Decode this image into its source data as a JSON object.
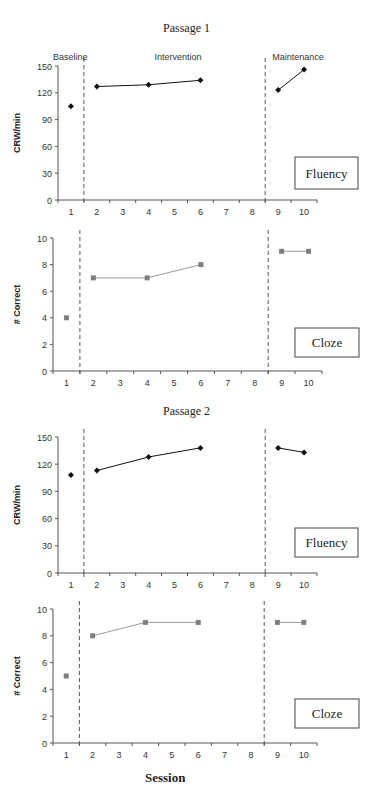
{
  "figure": {
    "xlabel": "Session",
    "phase_labels": {
      "baseline": "Baseline",
      "intervention": "Intervention",
      "maintenance": "Maintenance"
    }
  },
  "colors": {
    "fluency_series": "#111111",
    "cloze_series": "#7f7f7f",
    "cloze_line": "#999999",
    "axis": "#555555",
    "phase_line": "#555555",
    "text": "#333333"
  },
  "chart_data": [
    {
      "id": "passage1-fluency",
      "type": "line",
      "section_title": "Passage 1",
      "title": "Fluency",
      "xlabel": "",
      "ylabel": "CRW/min",
      "ylim": [
        0,
        150
      ],
      "yticks": [
        0,
        30,
        60,
        90,
        120,
        150
      ],
      "categories": [
        1,
        2,
        3,
        4,
        5,
        6,
        7,
        8,
        9,
        10
      ],
      "phase_lines_after_session": [
        1,
        8
      ],
      "marker": "diamond",
      "show_phase_labels": true,
      "series": [
        {
          "name": "Baseline",
          "x": [
            1
          ],
          "values": [
            105
          ]
        },
        {
          "name": "Intervention",
          "x": [
            2,
            4,
            6
          ],
          "values": [
            127,
            129,
            134
          ]
        },
        {
          "name": "Maintenance",
          "x": [
            9,
            10
          ],
          "values": [
            123,
            146
          ]
        }
      ],
      "grid": false,
      "legend": "none"
    },
    {
      "id": "passage1-cloze",
      "type": "line",
      "title": "Cloze",
      "xlabel": "",
      "ylabel": "# Correct",
      "ylim": [
        0,
        10
      ],
      "yticks": [
        0,
        2,
        4,
        6,
        8,
        10
      ],
      "categories": [
        1,
        2,
        3,
        4,
        5,
        6,
        7,
        8,
        9,
        10
      ],
      "phase_lines_after_session": [
        1,
        8
      ],
      "marker": "square",
      "show_phase_labels": false,
      "series": [
        {
          "name": "Baseline",
          "x": [
            1
          ],
          "values": [
            4
          ]
        },
        {
          "name": "Intervention",
          "x": [
            2,
            4,
            6
          ],
          "values": [
            7,
            7,
            8
          ]
        },
        {
          "name": "Maintenance",
          "x": [
            9,
            10
          ],
          "values": [
            9,
            9
          ]
        }
      ],
      "grid": false,
      "legend": "none"
    },
    {
      "id": "passage2-fluency",
      "type": "line",
      "section_title": "Passage 2",
      "title": "Fluency",
      "xlabel": "",
      "ylabel": "CRW/min",
      "ylim": [
        0,
        150
      ],
      "yticks": [
        0,
        30,
        60,
        90,
        120,
        150
      ],
      "categories": [
        1,
        2,
        3,
        4,
        5,
        6,
        7,
        8,
        9,
        10
      ],
      "phase_lines_after_session": [
        1,
        8
      ],
      "marker": "diamond",
      "show_phase_labels": false,
      "series": [
        {
          "name": "Baseline",
          "x": [
            1
          ],
          "values": [
            108
          ]
        },
        {
          "name": "Intervention",
          "x": [
            2,
            4,
            6
          ],
          "values": [
            113,
            128,
            138
          ]
        },
        {
          "name": "Maintenance",
          "x": [
            9,
            10
          ],
          "values": [
            138,
            133
          ]
        }
      ],
      "grid": false,
      "legend": "none"
    },
    {
      "id": "passage2-cloze",
      "type": "line",
      "title": "Cloze",
      "xlabel": "Session",
      "ylabel": "# Correct",
      "ylim": [
        0,
        10
      ],
      "yticks": [
        0,
        2,
        4,
        6,
        8,
        10
      ],
      "categories": [
        1,
        2,
        3,
        4,
        5,
        6,
        7,
        8,
        9,
        10
      ],
      "phase_lines_after_session": [
        1,
        8
      ],
      "marker": "square",
      "show_phase_labels": false,
      "series": [
        {
          "name": "Baseline",
          "x": [
            1
          ],
          "values": [
            5
          ]
        },
        {
          "name": "Intervention",
          "x": [
            2,
            4,
            6
          ],
          "values": [
            8,
            9,
            9
          ]
        },
        {
          "name": "Maintenance",
          "x": [
            9,
            10
          ],
          "values": [
            9,
            9
          ]
        }
      ],
      "grid": false,
      "legend": "none"
    }
  ]
}
